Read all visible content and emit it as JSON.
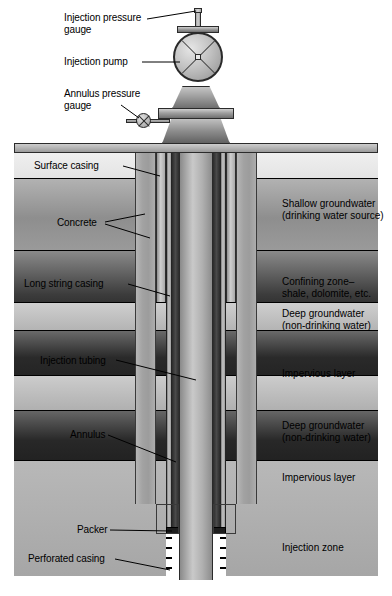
{
  "diagram": {
    "type": "engineering-cross-section"
  },
  "callouts": {
    "injection_pressure_gauge": "Injection pressure\ngauge",
    "injection_pump": "Injection pump",
    "annulus_pressure_gauge": "Annulus pressure\ngauge",
    "surface_casing": "Surface casing",
    "concrete": "Concrete",
    "long_string_casing": "Long string casing",
    "injection_tubing": "Injection tubing",
    "annulus": "Annulus",
    "packer": "Packer",
    "perforated_casing": "Perforated casing"
  },
  "strata": [
    {
      "id": "topsoil",
      "label": "",
      "top": 0,
      "height": 26
    },
    {
      "id": "shallow",
      "label": "Shallow groundwater\n(drinking water source)",
      "top": 26,
      "height": 72
    },
    {
      "id": "confining",
      "label": "Confining zone–\nshale, dolomite, etc.",
      "top": 98,
      "height": 52
    },
    {
      "id": "deep1",
      "label": "Deep groundwater\n(non-drinking water)",
      "top": 150,
      "height": 28
    },
    {
      "id": "impervious1",
      "label": "Impervious layer",
      "top": 178,
      "height": 45
    },
    {
      "id": "deep2",
      "label": "Deep groundwater\n(non-drinking water)",
      "top": 223,
      "height": 35
    },
    {
      "id": "impervious2",
      "label": "Impervious layer",
      "top": 258,
      "height": 50
    },
    {
      "id": "injection",
      "label": "Injection zone",
      "top": 308,
      "height": 116
    }
  ],
  "colors": {
    "line": "#000000",
    "steel_light": "#c9c9c9",
    "steel_dark": "#5a5a5a",
    "annulus_void": "#2b2b2b",
    "concrete": "#a6a6a6",
    "background": "#ffffff"
  },
  "icons": {
    "pump_wheel": "pump-wheel-icon",
    "pressure_gauge": "pressure-gauge-icon"
  }
}
